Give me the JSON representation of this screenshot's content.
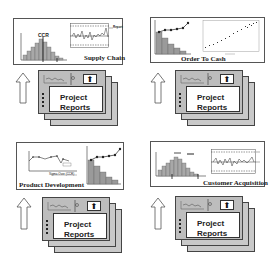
{
  "quadrants": [
    {
      "id": "supply-chain",
      "title": "Supply Chain",
      "histogram_label": "CCR",
      "left_chart": "histogram",
      "right_chart": "control-chart",
      "control_chart_label": "Report",
      "report_label_line1": "Project",
      "report_label_line2": "Reports",
      "arrow": "up-arrow",
      "report_button_icon": "up-arrow-icon"
    },
    {
      "id": "order-to-cash",
      "title": "Order To Cash",
      "left_chart": "pareto-chart",
      "right_chart": "scatter-plot",
      "report_label_line1": "Project",
      "report_label_line2": "Reports",
      "arrow": "up-arrow",
      "report_button_icon": "up-arrow-icon"
    },
    {
      "id": "product-development",
      "title": "Product Development",
      "left_chart": "line-chart",
      "right_chart": "pareto-chart",
      "line_chart_label": "Sigma Over",
      "line_chart_xlabel": "Sigma Over (CCR)",
      "report_label_line1": "Project",
      "report_label_line2": "Reports",
      "arrow": "up-arrow",
      "report_button_icon": "up-arrow-icon"
    },
    {
      "id": "customer-acquisition",
      "title": "Customer Acquisition",
      "left_chart": "histogram",
      "right_chart": "control-chart",
      "report_label_line1": "Project",
      "report_label_line2": "Reports",
      "arrow": "up-arrow",
      "report_button_icon": "up-arrow-icon"
    }
  ],
  "up_glyph": "⬆",
  "colors": {
    "panel_border": "#555555",
    "sheet_fill": "#c9c9c9",
    "bar_fill": "#9a9a9a",
    "line": "#333333"
  }
}
